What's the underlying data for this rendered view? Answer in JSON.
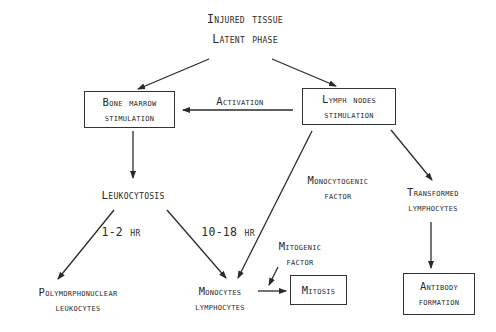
{
  "diagram": {
    "type": "flowchart",
    "nodes": {
      "injured": {
        "line1": "Injured tissue",
        "line2": "Latent phase"
      },
      "bone_marrow": {
        "line1": "Bone marrow",
        "line2": "stimulation"
      },
      "lymph_nodes": {
        "line1": "Lymph nodes",
        "line2": "stimulation"
      },
      "leukocytosis": {
        "label": "Leukocytosis"
      },
      "transformed": {
        "line1": "Transformed",
        "line2": "lymphocytes"
      },
      "polymorpho": {
        "line1": "Polymorphonuclear",
        "line2": "leukocytes"
      },
      "monocytes": {
        "line1": "Monocytes",
        "line2": "lymphocytes"
      },
      "mitosis": {
        "label": "Mitosis"
      },
      "antibody": {
        "line1": "Antibody",
        "line2": "formation"
      }
    },
    "edge_labels": {
      "activation": "Activation",
      "monocytogenic_1": "Monocytogenic",
      "monocytogenic_2": "factor",
      "mitogenic_1": "Mitogenic",
      "mitogenic_2": "factor",
      "time_short": "1-2 hr",
      "time_long": "10-18 hr"
    },
    "edges": [
      {
        "from": "injured",
        "to": "bone_marrow"
      },
      {
        "from": "injured",
        "to": "lymph_nodes"
      },
      {
        "from": "lymph_nodes",
        "to": "bone_marrow",
        "label": "Activation"
      },
      {
        "from": "bone_marrow",
        "to": "leukocytosis"
      },
      {
        "from": "lymph_nodes",
        "to": "monocytes",
        "label": "Monocytogenic factor"
      },
      {
        "from": "lymph_nodes",
        "to": "transformed"
      },
      {
        "from": "leukocytosis",
        "to": "polymorpho",
        "label": "1-2 hr"
      },
      {
        "from": "leukocytosis",
        "to": "monocytes",
        "label": "10-18 hr"
      },
      {
        "from": "monocytes",
        "to": "mitosis",
        "label": "Mitogenic factor"
      },
      {
        "from": "transformed",
        "to": "antibody"
      }
    ]
  }
}
